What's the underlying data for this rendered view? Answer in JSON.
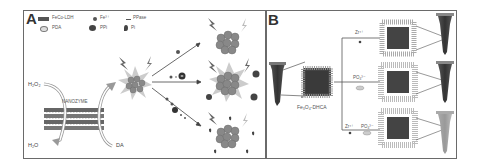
{
  "figure": {
    "panels": [
      {
        "label": "A",
        "legend": [
          {
            "symbol": "bar",
            "text": "FeCo-LDH"
          },
          {
            "symbol": "dot",
            "text": "Fe³⁺"
          },
          {
            "symbol": "dash",
            "text": "PPase"
          },
          {
            "symbol": "ellipse",
            "text": "PDA"
          },
          {
            "symbol": "ppi-shape",
            "text": "PPi"
          },
          {
            "symbol": "pi-shape",
            "text": "Pi"
          }
        ],
        "labels": {
          "h2o2": "H₂O₂",
          "h2o": "H₂O",
          "nanozyme": "NANOZYME",
          "da": "DA"
        }
      },
      {
        "label": "B",
        "labels": {
          "core": "Fe₃O₄-DHCA",
          "branch_top": "Zr⁴⁺",
          "branch_mid": "PO₄³⁻",
          "branch_bot_1": "Zr⁴⁺",
          "branch_bot_2": "PO₄³⁻"
        }
      }
    ],
    "colors": {
      "frame": "#6a6a6a",
      "dark_fill": "#4a4a4a",
      "mid_gray": "#8a8a8a",
      "light_gray": "#c8c8c8"
    }
  }
}
